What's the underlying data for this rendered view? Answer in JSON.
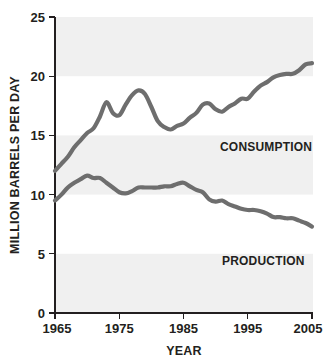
{
  "chart_data": {
    "type": "line",
    "title": "",
    "xlabel": "YEAR",
    "ylabel": "MILLION BARRELS PER DAY",
    "xlim": [
      1965,
      2005
    ],
    "ylim": [
      0,
      25
    ],
    "grid": false,
    "legend_position": "inline-annotations",
    "background_bands": [
      "0-5",
      "10-15",
      "20-25"
    ],
    "line_color": "#6e6e6e",
    "axis_color": "#231f20",
    "band_color": "#f0f0f0",
    "xticks": [
      1965,
      1975,
      1985,
      1995,
      2005
    ],
    "xtick_labels": [
      "1965",
      "1975",
      "1985",
      "1995",
      "2005"
    ],
    "yticks": [
      0,
      5,
      10,
      15,
      20,
      25
    ],
    "ytick_labels": [
      "0",
      "5",
      "10",
      "15",
      "20",
      "25"
    ],
    "x": [
      1965,
      1966,
      1967,
      1968,
      1969,
      1970,
      1971,
      1972,
      1973,
      1974,
      1975,
      1976,
      1977,
      1978,
      1979,
      1980,
      1981,
      1982,
      1983,
      1984,
      1985,
      1986,
      1987,
      1988,
      1989,
      1990,
      1991,
      1992,
      1993,
      1994,
      1995,
      1996,
      1997,
      1998,
      1999,
      2000,
      2001,
      2002,
      2003,
      2004,
      2005
    ],
    "series": [
      {
        "name": "CONSUMPTION",
        "label": "CONSUMPTION",
        "color": "#6e6e6e",
        "values": [
          12.0,
          12.6,
          13.2,
          14.0,
          14.6,
          15.2,
          15.6,
          16.6,
          17.8,
          16.9,
          16.7,
          17.6,
          18.4,
          18.8,
          18.5,
          17.4,
          16.2,
          15.7,
          15.5,
          15.8,
          16.0,
          16.5,
          16.9,
          17.6,
          17.7,
          17.2,
          17.0,
          17.4,
          17.7,
          18.1,
          18.1,
          18.7,
          19.2,
          19.5,
          19.9,
          20.1,
          20.2,
          20.2,
          20.5,
          21.0,
          21.1
        ]
      },
      {
        "name": "PRODUCTION",
        "label": "PRODUCTION",
        "color": "#6e6e6e",
        "values": [
          9.5,
          10.0,
          10.6,
          11.0,
          11.3,
          11.6,
          11.4,
          11.4,
          11.0,
          10.6,
          10.2,
          10.1,
          10.3,
          10.6,
          10.6,
          10.6,
          10.6,
          10.7,
          10.7,
          10.9,
          11.0,
          10.7,
          10.4,
          10.2,
          9.6,
          9.4,
          9.5,
          9.2,
          9.0,
          8.8,
          8.7,
          8.7,
          8.6,
          8.4,
          8.1,
          8.1,
          8.0,
          8.0,
          7.8,
          7.6,
          7.3
        ]
      }
    ],
    "annotations": [
      {
        "text": "CONSUMPTION",
        "x": 1993,
        "y": 16.0
      },
      {
        "text": "PRODUCTION",
        "x": 1993,
        "y": 6.4
      }
    ]
  }
}
